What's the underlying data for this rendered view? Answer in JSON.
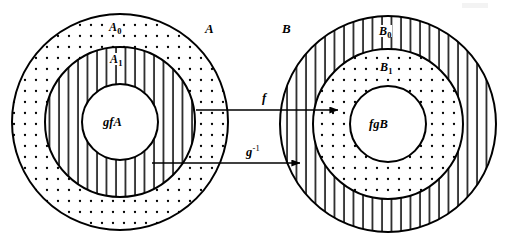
{
  "figure": {
    "kind": "set-mapping-diagram",
    "width": 505,
    "height": 244,
    "background_color": "#ffffff",
    "stroke_color": "#000000"
  },
  "left_set": {
    "name": "A",
    "label": "A",
    "center": {
      "x": 120,
      "y": 122
    },
    "radii": {
      "outer": 108,
      "middle": 75,
      "inner": 38
    },
    "outer_ring": {
      "label": "A",
      "subscript": "0",
      "pattern": "dotted",
      "label_x": 118,
      "label_y": 27
    },
    "middle_ring": {
      "label": "A",
      "subscript": "1",
      "pattern": "vertical-lines",
      "label_x": 118,
      "label_y": 59
    },
    "inner_disc": {
      "label": "gfA",
      "pattern": "blank",
      "label_x": 120,
      "label_y": 122
    },
    "set_label_x": 205,
    "set_label_y": 29
  },
  "right_set": {
    "name": "B",
    "label": "B",
    "center": {
      "x": 388,
      "y": 124
    },
    "radii": {
      "outer": 108,
      "middle": 75,
      "inner": 38
    },
    "outer_ring": {
      "label": "B",
      "subscript": "0",
      "pattern": "vertical-lines",
      "label_x": 388,
      "label_y": 31
    },
    "middle_ring": {
      "label": "B",
      "subscript": "1",
      "pattern": "dotted",
      "label_x": 388,
      "label_y": 67
    },
    "inner_disc": {
      "label": "fgB",
      "pattern": "blank",
      "label_x": 388,
      "label_y": 124
    },
    "set_label_x": 282,
    "set_label_y": 29
  },
  "arrows": [
    {
      "id": "arrow-f",
      "label": "f",
      "superscript": "",
      "label_x": 262,
      "label_y": 99,
      "x1": 196,
      "y1": 110,
      "x2": 338,
      "y2": 110
    },
    {
      "id": "arrow-g-inverse",
      "label": "g",
      "superscript": "-1",
      "label_x": 252,
      "label_y": 153,
      "x1": 152,
      "y1": 163,
      "x2": 300,
      "y2": 163
    }
  ],
  "colors": {
    "ink": "#000000",
    "paper": "#ffffff",
    "artifact": "#e9e9e9"
  }
}
